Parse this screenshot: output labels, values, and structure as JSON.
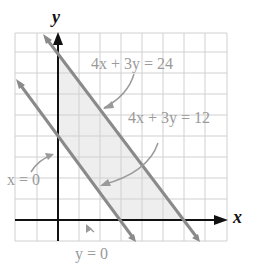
{
  "diagram": {
    "type": "linear inequality region graph",
    "axes": {
      "x_label": "x",
      "y_label": "y"
    },
    "grid": {
      "x_min": -2,
      "x_max": 8,
      "y_min": -1,
      "y_max": 9,
      "step": 1
    },
    "lines": [
      {
        "equation": "4x + 3y = 24",
        "x_intercept": 6,
        "y_intercept": 8
      },
      {
        "equation": "4x + 3y = 12",
        "x_intercept": 3,
        "y_intercept": 4
      }
    ],
    "boundary_labels": [
      {
        "id": "x0",
        "text": "x = 0"
      },
      {
        "id": "y0",
        "text": "y = 0"
      }
    ],
    "shaded_region": "12 ≤ 4x + 3y ≤ 24, x ≥ 0, y ≥ 0",
    "colors": {
      "grid": "#cfcfcf",
      "axes": "#111111",
      "lines": "#8a8a8a",
      "shade": "#eeeeee",
      "labels": "#9a9a9a"
    }
  },
  "labels": {
    "y_axis": "y",
    "x_axis": "x",
    "eq24": "4x + 3y = 24",
    "eq12": "4x + 3y = 12",
    "x0": "x = 0",
    "y0": "y = 0"
  }
}
